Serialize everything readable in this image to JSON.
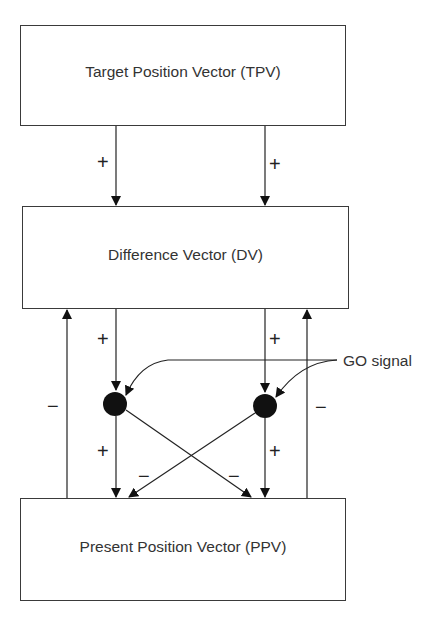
{
  "diagram": {
    "boxes": {
      "tpv": "Target Position Vector (TPV)",
      "dv": "Difference Vector (DV)",
      "ppv": "Present Position Vector (PPV)"
    },
    "signs": {
      "tpv_dv_left": "+",
      "tpv_dv_right": "+",
      "dv_go_left": "+",
      "dv_go_right": "+",
      "go_ppv_left": "+",
      "go_ppv_right": "+",
      "cross_left": "−",
      "cross_right": "−",
      "feedback_left": "−",
      "feedback_right": "−"
    },
    "go_signal_label": "GO signal",
    "colors": {
      "line": "#222222",
      "node": "#111111",
      "text": "#333333"
    }
  }
}
